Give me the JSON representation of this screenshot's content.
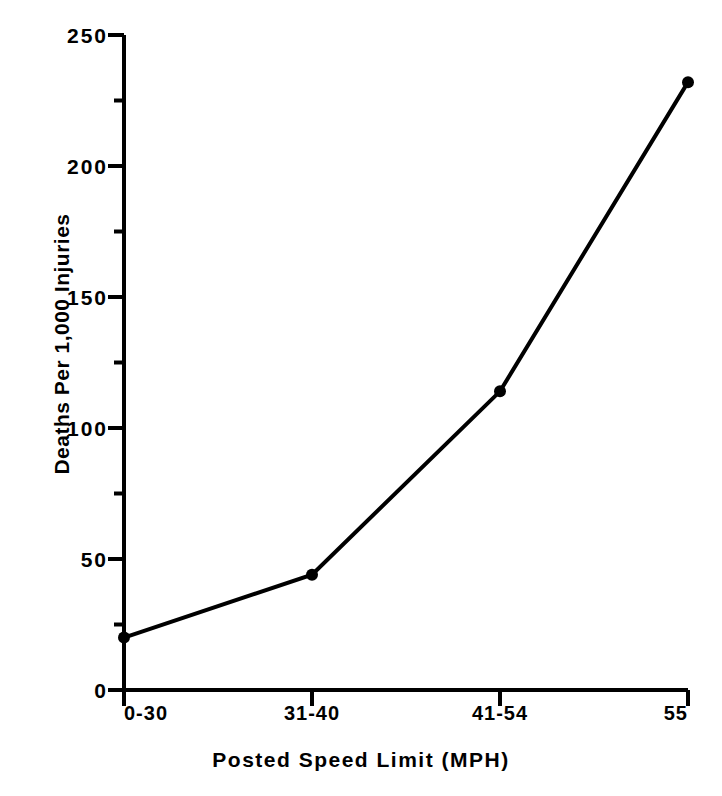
{
  "chart_data": {
    "type": "line",
    "title": "",
    "subtitle": "",
    "xlabel": "Posted Speed Limit   (MPH)",
    "ylabel": "Deaths Per 1,000 Injuries",
    "categories": [
      "0-30",
      "31-40",
      "41-54",
      "55"
    ],
    "values": [
      20,
      44,
      114,
      232
    ],
    "series": [
      {
        "name": "Deaths Per 1,000 Injuries",
        "values": [
          20,
          44,
          114,
          232
        ]
      }
    ],
    "ylim": [
      0,
      250
    ],
    "y_major_ticks": [
      0,
      50,
      100,
      150,
      200,
      250
    ],
    "y_minor_ticks": [
      25,
      75,
      125,
      175,
      225
    ],
    "y_tick_labels": [
      "0",
      "50",
      "100",
      "150",
      "200",
      "250"
    ],
    "x_tick_labels": [
      "0-30",
      "31-40",
      "41-54",
      "55"
    ],
    "grid": false,
    "legend": false,
    "legend_position": "none",
    "marker": "circle",
    "line_color": "#000000",
    "marker_color": "#000000",
    "background_color": "#ffffff",
    "annotations": []
  },
  "figure": {
    "background_color": "#ffffff",
    "axis_color": "#000000"
  }
}
